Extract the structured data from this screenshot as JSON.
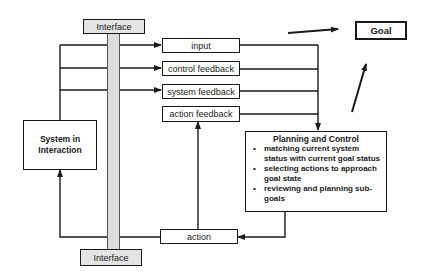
{
  "diagram": {
    "interface": {
      "top_label": "Interface",
      "bottom_label": "Interface"
    },
    "system": {
      "line1": "System in",
      "line2": "Interaction"
    },
    "signals": [
      {
        "label": "input"
      },
      {
        "label": "control feedback"
      },
      {
        "label": "system feedback"
      },
      {
        "label": "action feedback"
      }
    ],
    "action": {
      "label": "action"
    },
    "goal": {
      "label": "Goal"
    },
    "planning": {
      "title": "Planning and Control",
      "bullets": [
        "matching current system status with current goal status",
        "selecting actions to approach goal state",
        "reviewing and planning sub-goals"
      ]
    },
    "colors": {
      "line": "#1a1a1a",
      "interface_fill": "#dcdcdc"
    }
  }
}
